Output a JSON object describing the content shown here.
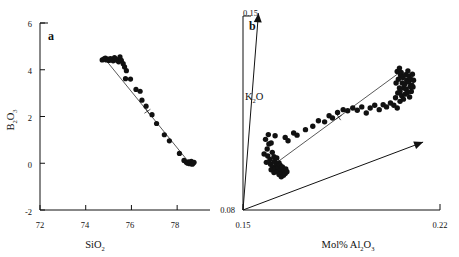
{
  "figure": {
    "panels": [
      {
        "id": "a",
        "label": "a",
        "xlabel_main": "SiO",
        "xlabel_sub": "2",
        "ylabel_main_1": "B",
        "ylabel_sub_1": "2",
        "ylabel_main_2": "O",
        "ylabel_sub_2": "3",
        "xticks": [
          "72",
          "74",
          "76",
          "78"
        ],
        "yticks": [
          "6",
          "4",
          "2",
          "0",
          "-2"
        ]
      },
      {
        "id": "b",
        "label": "b",
        "xlabel_main": "Mol% Al",
        "xlabel_sub_1": "2",
        "xlabel_mid": "O",
        "xlabel_sub_2": "3",
        "ylabel_main_1": "K",
        "ylabel_sub_1": "2",
        "ylabel_main_2": "O",
        "xticks": [
          "0.15",
          "0.22"
        ],
        "yticks": [
          "0.08",
          "0.15"
        ]
      }
    ]
  },
  "chart_data": [
    {
      "type": "scatter",
      "panel": "a",
      "title": "a",
      "xlabel": "SiO2",
      "ylabel": "B2O3",
      "xlim": [
        72,
        79
      ],
      "ylim": [
        -2,
        6
      ],
      "xticks": [
        72,
        74,
        76,
        78
      ],
      "yticks": [
        -2,
        0,
        2,
        4,
        6
      ],
      "grid": false,
      "legend": "none",
      "tie_line": {
        "x": [
          74.85,
          78.55
        ],
        "y": [
          4.45,
          0.0
        ],
        "midpoint_marker": "cross"
      },
      "points": [
        [
          74.72,
          4.42
        ],
        [
          74.8,
          4.47
        ],
        [
          74.86,
          4.5
        ],
        [
          74.9,
          4.42
        ],
        [
          74.96,
          4.46
        ],
        [
          75.02,
          4.4
        ],
        [
          75.08,
          4.48
        ],
        [
          75.14,
          4.44
        ],
        [
          75.2,
          4.38
        ],
        [
          75.26,
          4.52
        ],
        [
          75.32,
          4.46
        ],
        [
          75.38,
          4.4
        ],
        [
          75.44,
          4.34
        ],
        [
          75.5,
          4.55
        ],
        [
          75.56,
          4.4
        ],
        [
          75.64,
          4.26
        ],
        [
          75.7,
          4.12
        ],
        [
          75.78,
          3.96
        ],
        [
          75.74,
          3.62
        ],
        [
          75.96,
          3.6
        ],
        [
          76.2,
          3.16
        ],
        [
          76.38,
          3.08
        ],
        [
          76.46,
          2.7
        ],
        [
          76.64,
          2.44
        ],
        [
          76.9,
          2.08
        ],
        [
          77.1,
          1.7
        ],
        [
          77.44,
          1.22
        ],
        [
          77.66,
          0.96
        ],
        [
          78.1,
          0.42
        ],
        [
          78.3,
          0.12
        ],
        [
          78.4,
          0.04
        ],
        [
          78.46,
          0.0
        ],
        [
          78.5,
          0.06
        ],
        [
          78.54,
          -0.02
        ],
        [
          78.58,
          0.02
        ],
        [
          78.62,
          0.08
        ],
        [
          78.66,
          -0.04
        ],
        [
          78.7,
          0.0
        ],
        [
          78.74,
          0.04
        ]
      ]
    },
    {
      "type": "scatter",
      "panel": "b",
      "title": "b",
      "xlabel": "Mol% Al2O3",
      "ylabel": "K2O",
      "xlim": [
        0.15,
        0.22
      ],
      "ylim": [
        0.08,
        0.15
      ],
      "xticks": [
        0.15,
        0.22
      ],
      "yticks": [
        0.08,
        0.15
      ],
      "grid": false,
      "legend": "none",
      "tie_line": {
        "x": [
          0.1625,
          0.2055
        ],
        "y": [
          0.0975,
          0.1295
        ],
        "midpoint_marker": "cross"
      },
      "arrows": [
        {
          "name": "k2o-axis-arrow",
          "from": [
            0.15,
            0.08
          ],
          "to": [
            0.1555,
            0.151
          ]
        },
        {
          "name": "al2o3-trend-arrow",
          "from": [
            0.15,
            0.08
          ],
          "to": [
            0.214,
            0.1045
          ]
        }
      ],
      "points": [
        [
          0.158,
          0.1055
        ],
        [
          0.1592,
          0.1038
        ],
        [
          0.1586,
          0.102
        ],
        [
          0.16,
          0.1042
        ],
        [
          0.1575,
          0.1002
        ],
        [
          0.1588,
          0.0995
        ],
        [
          0.1596,
          0.0982
        ],
        [
          0.1604,
          0.1008
        ],
        [
          0.161,
          0.0992
        ],
        [
          0.1583,
          0.0972
        ],
        [
          0.1598,
          0.0965
        ],
        [
          0.1612,
          0.0975
        ],
        [
          0.162,
          0.0988
        ],
        [
          0.1606,
          0.0955
        ],
        [
          0.1618,
          0.0962
        ],
        [
          0.1628,
          0.097
        ],
        [
          0.16,
          0.0945
        ],
        [
          0.1614,
          0.0948
        ],
        [
          0.1624,
          0.0952
        ],
        [
          0.1632,
          0.0962
        ],
        [
          0.161,
          0.0935
        ],
        [
          0.1622,
          0.0938
        ],
        [
          0.1634,
          0.0945
        ],
        [
          0.164,
          0.0955
        ],
        [
          0.1628,
          0.0928
        ],
        [
          0.1638,
          0.0932
        ],
        [
          0.1646,
          0.094
        ],
        [
          0.1652,
          0.0948
        ],
        [
          0.1636,
          0.092
        ],
        [
          0.1644,
          0.0925
        ],
        [
          0.165,
          0.0932
        ],
        [
          0.1656,
          0.0938
        ],
        [
          0.159,
          0.1072
        ],
        [
          0.1614,
          0.1068
        ],
        [
          0.165,
          0.1062
        ],
        [
          0.166,
          0.105
        ],
        [
          0.168,
          0.1078
        ],
        [
          0.1692,
          0.107
        ],
        [
          0.1722,
          0.109
        ],
        [
          0.1748,
          0.1102
        ],
        [
          0.1768,
          0.1122
        ],
        [
          0.179,
          0.1118
        ],
        [
          0.1806,
          0.114
        ],
        [
          0.1818,
          0.1132
        ],
        [
          0.1836,
          0.1152
        ],
        [
          0.1856,
          0.1162
        ],
        [
          0.1872,
          0.1158
        ],
        [
          0.189,
          0.1168
        ],
        [
          0.1906,
          0.116
        ],
        [
          0.1922,
          0.1172
        ],
        [
          0.1938,
          0.115
        ],
        [
          0.1952,
          0.1168
        ],
        [
          0.1968,
          0.1178
        ],
        [
          0.1984,
          0.1162
        ],
        [
          0.1998,
          0.118
        ],
        [
          0.201,
          0.1172
        ],
        [
          0.2024,
          0.1186
        ],
        [
          0.2036,
          0.1178
        ],
        [
          0.2048,
          0.1168
        ],
        [
          0.2058,
          0.1192
        ],
        [
          0.2042,
          0.1205
        ],
        [
          0.205,
          0.1222
        ],
        [
          0.2056,
          0.124
        ],
        [
          0.2044,
          0.1258
        ],
        [
          0.2052,
          0.1272
        ],
        [
          0.206,
          0.1286
        ],
        [
          0.2048,
          0.13
        ],
        [
          0.2056,
          0.1312
        ],
        [
          0.2062,
          0.1296
        ],
        [
          0.2068,
          0.1278
        ],
        [
          0.2066,
          0.1258
        ],
        [
          0.2072,
          0.124
        ],
        [
          0.2058,
          0.1228
        ],
        [
          0.2064,
          0.1212
        ],
        [
          0.207,
          0.12
        ],
        [
          0.2076,
          0.1218
        ],
        [
          0.208,
          0.1236
        ],
        [
          0.2074,
          0.1254
        ],
        [
          0.2082,
          0.1268
        ],
        [
          0.2078,
          0.1288
        ],
        [
          0.2086,
          0.1302
        ],
        [
          0.209,
          0.1284
        ],
        [
          0.2088,
          0.1262
        ],
        [
          0.2094,
          0.1246
        ],
        [
          0.2084,
          0.1224
        ],
        [
          0.2092,
          0.1208
        ],
        [
          0.2098,
          0.1228
        ],
        [
          0.21,
          0.125
        ],
        [
          0.2096,
          0.1272
        ],
        [
          0.2102,
          0.129
        ],
        [
          0.2106,
          0.1268
        ],
        [
          0.2104,
          0.1244
        ]
      ]
    }
  ]
}
